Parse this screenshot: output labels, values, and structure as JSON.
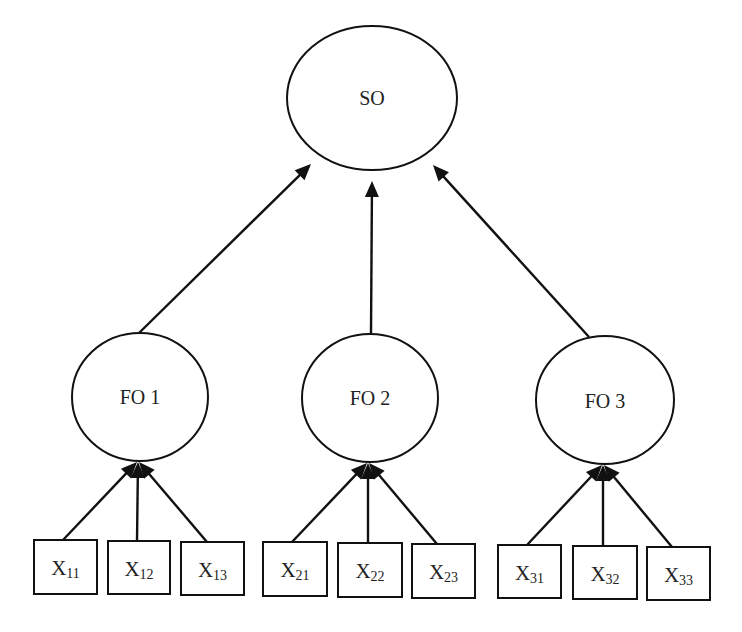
{
  "diagram": {
    "title": "",
    "second_order": {
      "id": "SO",
      "label": "SO"
    },
    "first_order": [
      {
        "id": "FO1",
        "label": "FO 1"
      },
      {
        "id": "FO2",
        "label": "FO 2"
      },
      {
        "id": "FO3",
        "label": "FO 3"
      }
    ],
    "indicators": [
      {
        "id": "X11",
        "main": "X",
        "sub": "11",
        "parent": "FO1"
      },
      {
        "id": "X12",
        "main": "X",
        "sub": "12",
        "parent": "FO1"
      },
      {
        "id": "X13",
        "main": "X",
        "sub": "13",
        "parent": "FO1"
      },
      {
        "id": "X21",
        "main": "X",
        "sub": "21",
        "parent": "FO2"
      },
      {
        "id": "X22",
        "main": "X",
        "sub": "22",
        "parent": "FO2"
      },
      {
        "id": "X23",
        "main": "X",
        "sub": "23",
        "parent": "FO2"
      },
      {
        "id": "X31",
        "main": "X",
        "sub": "31",
        "parent": "FO3"
      },
      {
        "id": "X32",
        "main": "X",
        "sub": "32",
        "parent": "FO3"
      },
      {
        "id": "X33",
        "main": "X",
        "sub": "33",
        "parent": "FO3"
      }
    ],
    "edges": [
      {
        "from": "FO1",
        "to": "SO"
      },
      {
        "from": "FO2",
        "to": "SO"
      },
      {
        "from": "FO3",
        "to": "SO"
      },
      {
        "from": "X11",
        "to": "FO1"
      },
      {
        "from": "X12",
        "to": "FO1"
      },
      {
        "from": "X13",
        "to": "FO1"
      },
      {
        "from": "X21",
        "to": "FO2"
      },
      {
        "from": "X22",
        "to": "FO2"
      },
      {
        "from": "X23",
        "to": "FO2"
      },
      {
        "from": "X31",
        "to": "FO3"
      },
      {
        "from": "X32",
        "to": "FO3"
      },
      {
        "from": "X33",
        "to": "FO3"
      }
    ],
    "colors": {
      "stroke": "#111111",
      "text": "#222222",
      "background": "#ffffff"
    }
  }
}
